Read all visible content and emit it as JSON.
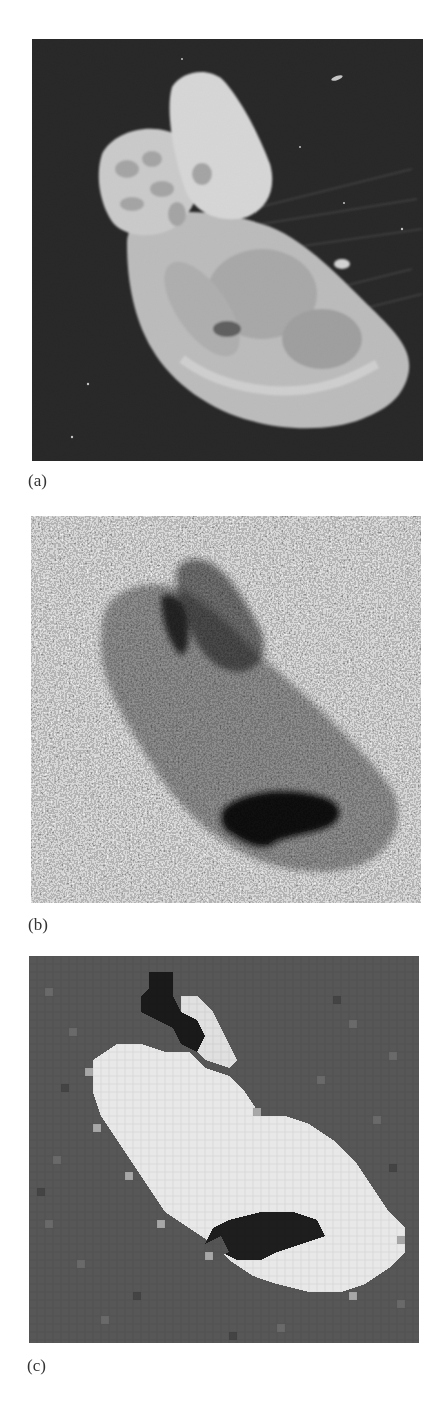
{
  "figure": {
    "panels": [
      {
        "id": "a",
        "label": "(a)",
        "description": "High-resolution grayscale brain section image, bright tissue on black background",
        "background_color": "#0a0a0a",
        "tissue_color": "#d8d8d8"
      },
      {
        "id": "b",
        "label": "(b)",
        "description": "Noisy low-SNR image of the same section, darker tissue on speckled background",
        "background_color": "#a0a0a0",
        "tissue_color": "#6a6a6a"
      },
      {
        "id": "c",
        "label": "(c)",
        "description": "Low-resolution pixelated reconstruction, bright tissue on gray background",
        "background_color": "#555555",
        "tissue_color": "#e6e6e6"
      }
    ]
  }
}
